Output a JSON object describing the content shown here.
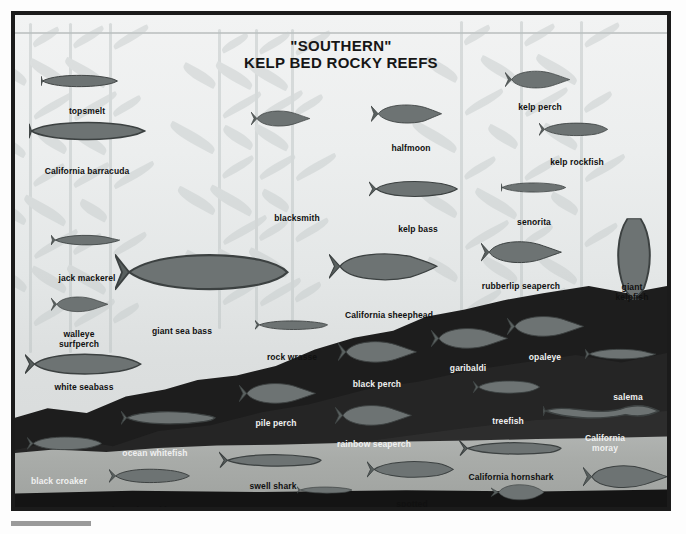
{
  "poster": {
    "title_line1": "\"SOUTHERN\"",
    "title_line2": "KELP BED ROCKY REEFS",
    "frame_color": "#1b1b1b",
    "water_color": "#eceeee",
    "reef_color": "#1d1d1d",
    "sand_color": "#a9aca9",
    "label_color": "#101010",
    "label_color_light": "#f0f0f0"
  },
  "species": [
    {
      "id": "topsmelt",
      "name": "topsmelt",
      "x": 76,
      "y": 95,
      "tone": "dark",
      "fx": 30,
      "fy": 62,
      "fw": 78,
      "shape": "slender"
    },
    {
      "id": "california-barracuda",
      "name": "California barracuda",
      "x": 76,
      "y": 155,
      "tone": "dark",
      "fx": 18,
      "fy": 108,
      "fw": 118,
      "shape": "slender"
    },
    {
      "id": "jack-mackerel",
      "name": "jack mackerel",
      "x": 76,
      "y": 262,
      "tone": "dark",
      "fx": 40,
      "fy": 222,
      "fw": 70,
      "shape": "torpedo"
    },
    {
      "id": "walleye-surfperch",
      "name": "walleye\nsurfperch",
      "x": 68,
      "y": 318,
      "tone": "dark",
      "fx": 40,
      "fy": 284,
      "fw": 58,
      "shape": "perch"
    },
    {
      "id": "white-seabass",
      "name": "white seabass",
      "x": 73,
      "y": 371,
      "tone": "dark",
      "fx": 14,
      "fy": 340,
      "fw": 118,
      "shape": "bass"
    },
    {
      "id": "black-croaker",
      "name": "black croaker",
      "x": 48,
      "y": 465,
      "tone": "light",
      "fx": 16,
      "fy": 424,
      "fw": 76,
      "shape": "croaker"
    },
    {
      "id": "barred-sand-bass",
      "name": "barred sand bass",
      "x": 137,
      "y": 494,
      "tone": "dark",
      "fx": 98,
      "fy": 456,
      "fw": 82,
      "shape": "bass"
    },
    {
      "id": "giant-sea-bass",
      "name": "giant sea bass",
      "x": 171,
      "y": 315,
      "tone": "dark",
      "fx": 104,
      "fy": 240,
      "fw": 176,
      "shape": "giant"
    },
    {
      "id": "ocean-whitefish",
      "name": "ocean whitefish",
      "x": 144,
      "y": 437,
      "tone": "light",
      "fx": 110,
      "fy": 398,
      "fw": 96,
      "shape": "whitefish"
    },
    {
      "id": "blacksmith",
      "name": "blacksmith",
      "x": 286,
      "y": 202,
      "tone": "dark",
      "fx": 240,
      "fy": 98,
      "fw": 60,
      "shape": "perch"
    },
    {
      "id": "halfmoon",
      "name": "halfmoon",
      "x": 400,
      "y": 132,
      "tone": "dark",
      "fx": 360,
      "fy": 92,
      "fw": 72,
      "shape": "halfmoon"
    },
    {
      "id": "kelp-bass",
      "name": "kelp bass",
      "x": 407,
      "y": 213,
      "tone": "dark",
      "fx": 358,
      "fy": 168,
      "fw": 90,
      "shape": "bass"
    },
    {
      "id": "rock-wrasse",
      "name": "rock wrasse",
      "x": 281,
      "y": 341,
      "tone": "dark",
      "fx": 244,
      "fy": 308,
      "fw": 74,
      "shape": "wrasse"
    },
    {
      "id": "california-sheephead",
      "name": "California sheephead",
      "x": 378,
      "y": 299,
      "tone": "dark",
      "fx": 318,
      "fy": 240,
      "fw": 110,
      "shape": "sheephead"
    },
    {
      "id": "black-perch",
      "name": "black perch",
      "x": 366,
      "y": 368,
      "tone": "light",
      "fx": 327,
      "fy": 328,
      "fw": 80,
      "shape": "perch"
    },
    {
      "id": "pile-perch",
      "name": "pile perch",
      "x": 265,
      "y": 407,
      "tone": "light",
      "fx": 228,
      "fy": 370,
      "fw": 78,
      "shape": "perch"
    },
    {
      "id": "rainbow-seaperch",
      "name": "rainbow seaperch",
      "x": 363,
      "y": 428,
      "tone": "light",
      "fx": 324,
      "fy": 392,
      "fw": 78,
      "shape": "perch"
    },
    {
      "id": "garibaldi",
      "name": "garibaldi",
      "x": 457,
      "y": 352,
      "tone": "light",
      "fx": 420,
      "fy": 315,
      "fw": 78,
      "shape": "perch"
    },
    {
      "id": "opaleye",
      "name": "opaleye",
      "x": 534,
      "y": 341,
      "tone": "light",
      "fx": 496,
      "fy": 303,
      "fw": 78,
      "shape": "perch"
    },
    {
      "id": "salema",
      "name": "salema",
      "x": 617,
      "y": 381,
      "tone": "light",
      "fx": 574,
      "fy": 336,
      "fw": 72,
      "shape": "torpedo"
    },
    {
      "id": "treefish",
      "name": "treefish",
      "x": 497,
      "y": 405,
      "tone": "light",
      "fx": 462,
      "fy": 368,
      "fw": 68,
      "shape": "rockfish"
    },
    {
      "id": "california-moray",
      "name": "California moray",
      "x": 594,
      "y": 422,
      "tone": "light",
      "fx": 532,
      "fy": 388,
      "fw": 118,
      "shape": "eel"
    },
    {
      "id": "california-hornshark",
      "name": "California hornshark",
      "x": 500,
      "y": 461,
      "tone": "dark",
      "fx": 448,
      "fy": 428,
      "fw": 104,
      "shape": "shark"
    },
    {
      "id": "co-turbot",
      "name": "CO turbot",
      "x": 532,
      "y": 495,
      "tone": "dark",
      "fx": 480,
      "fy": 472,
      "fw": 54,
      "shape": "flatfish"
    },
    {
      "id": "sargo",
      "name": "sargo",
      "x": 615,
      "y": 494,
      "tone": "dark",
      "fx": 572,
      "fy": 452,
      "fw": 86,
      "shape": "perch"
    },
    {
      "id": "swell-shark",
      "name": "swell shark",
      "x": 262,
      "y": 470,
      "tone": "dark",
      "fx": 208,
      "fy": 440,
      "fw": 104,
      "shape": "shark"
    },
    {
      "id": "blackeye-goby",
      "name": "blackeye goby",
      "x": 318,
      "y": 496,
      "tone": "dark",
      "fx": 286,
      "fy": 474,
      "fw": 56,
      "shape": "goby"
    },
    {
      "id": "spotted-scorpionfish",
      "name": "spotted\nscorpionfish",
      "x": 401,
      "y": 488,
      "tone": "dark",
      "fx": 356,
      "fy": 448,
      "fw": 88,
      "shape": "rockfish"
    },
    {
      "id": "kelp-perch",
      "name": "kelp perch",
      "x": 529,
      "y": 91,
      "tone": "dark",
      "fx": 494,
      "fy": 58,
      "fw": 66,
      "shape": "perch"
    },
    {
      "id": "kelp-rockfish",
      "name": "kelp rockfish",
      "x": 566,
      "y": 146,
      "tone": "dark",
      "fx": 528,
      "fy": 110,
      "fw": 70,
      "shape": "rockfish"
    },
    {
      "id": "senorita",
      "name": "senorita",
      "x": 523,
      "y": 206,
      "tone": "dark",
      "fx": 490,
      "fy": 170,
      "fw": 66,
      "shape": "slender"
    },
    {
      "id": "rubberlip-seaperch",
      "name": "rubberlip seaperch",
      "x": 510,
      "y": 270,
      "tone": "dark",
      "fx": 470,
      "fy": 228,
      "fw": 82,
      "shape": "perch"
    },
    {
      "id": "giant-kelpfish",
      "name": "giant kelpfish",
      "x": 621,
      "y": 271,
      "tone": "dark",
      "fx": 600,
      "fy": 206,
      "fw": 46,
      "shape": "kelpfish"
    }
  ]
}
